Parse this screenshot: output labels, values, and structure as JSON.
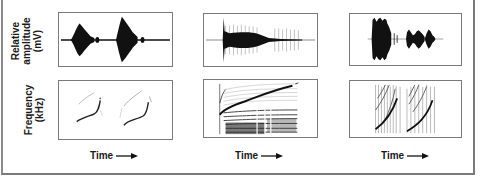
{
  "figure": {
    "row_labels": {
      "amplitude": {
        "line1": "Relative",
        "line2": "amplitude",
        "line3": "(mV)"
      },
      "frequency": {
        "line1": "Frequency",
        "line2": "(kHz)"
      }
    },
    "columns": [
      {
        "id": "col1",
        "x_label": "Time",
        "waveform": "two-symmetric-bursts",
        "spectrogram": "two-clean-upsweeps"
      },
      {
        "id": "col2",
        "x_label": "Time",
        "waveform": "sharp-onset-decaying-noisy",
        "spectrogram": "harmonic-rich-rising-sweep"
      },
      {
        "id": "col3",
        "x_label": "Time",
        "waveform": "dense-burst-then-smaller-burst",
        "spectrogram": "broadband-pulsed-upsweeps"
      }
    ],
    "arrow_icon": "right-arrow-icon",
    "colors": {
      "ink": "#111111",
      "frame": "#7a7a7a",
      "background": "#ffffff"
    }
  }
}
